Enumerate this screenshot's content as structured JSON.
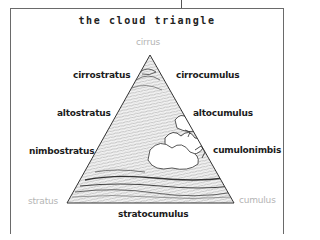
{
  "title": "the cloud triangle",
  "corners": {
    "top": "cirrus",
    "bottom_left": "stratus",
    "bottom_right": "cumulus"
  },
  "left_labels": [
    "cirrostratus",
    "altostratus",
    "nimbostratus"
  ],
  "right_labels": [
    "cirrocumulus",
    "altocumulus",
    "cumulonimbis"
  ],
  "bottom_label": "stratocumulus",
  "colors": {
    "border": "#6a6a6a",
    "label_text": "#1c1c1c",
    "corner_text": "#b4b4b4",
    "triangle_outline": "#333333",
    "texture": "#555555"
  },
  "triangle": {
    "apex": [
      150,
      55
    ],
    "base_left": [
      67,
      203
    ],
    "base_right": [
      234,
      203
    ]
  }
}
